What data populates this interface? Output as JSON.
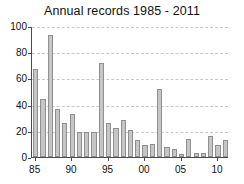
{
  "chart_data": {
    "type": "bar",
    "title": "Annual records 1985 - 2011",
    "xlabel": "",
    "ylabel": "",
    "categories": [
      "1985",
      "1986",
      "1987",
      "1988",
      "1989",
      "1990",
      "1991",
      "1992",
      "1993",
      "1994",
      "1995",
      "1996",
      "1997",
      "1998",
      "1999",
      "2000",
      "2001",
      "2002",
      "2003",
      "2004",
      "2005",
      "2006",
      "2007",
      "2008",
      "2009",
      "2010",
      "2011"
    ],
    "x_tick_labels": [
      "85",
      "90",
      "95",
      "00",
      "05",
      "10"
    ],
    "x_tick_categories": [
      "1985",
      "1990",
      "1995",
      "2000",
      "2005",
      "2010"
    ],
    "values": [
      67,
      44,
      93,
      37,
      26,
      33,
      19,
      19,
      19,
      72,
      26,
      22,
      28,
      21,
      13,
      9,
      10,
      52,
      8,
      6,
      2,
      14,
      3,
      3,
      16,
      9,
      13
    ],
    "ylim": [
      0,
      100
    ],
    "y_tick_labels": [
      "0",
      "20",
      "40",
      "60",
      "80",
      "100"
    ],
    "y_ticks": [
      0,
      20,
      40,
      60,
      80,
      100
    ],
    "grid": true,
    "legend": "none",
    "colors": {
      "bar_fill": "#c6c6c6",
      "bar_border": "#8f8f8f",
      "axis": "#4a4a4a",
      "grid": "#c9c9c9",
      "text": "#111111",
      "background": "#ffffff"
    }
  }
}
